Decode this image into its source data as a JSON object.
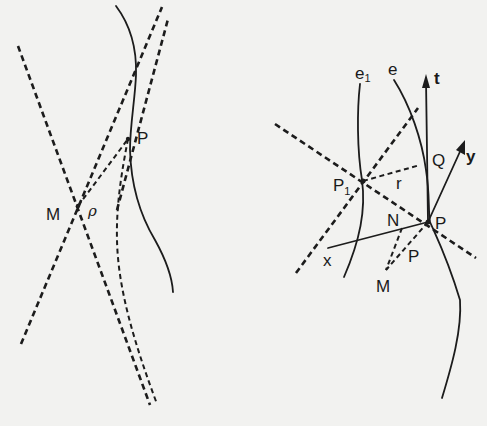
{
  "left_figure": {
    "labels": {
      "P": "P",
      "M": "M",
      "rho": "ρ"
    }
  },
  "right_figure": {
    "labels": {
      "e1": "e",
      "e1_sub": "1",
      "e": "e",
      "t": "t",
      "Q": "Q",
      "y": "y",
      "P1": "P",
      "P1_sub": "1",
      "r": "r",
      "N": "N",
      "P": "P",
      "x": "x",
      "M": "M",
      "rho": "P"
    }
  }
}
